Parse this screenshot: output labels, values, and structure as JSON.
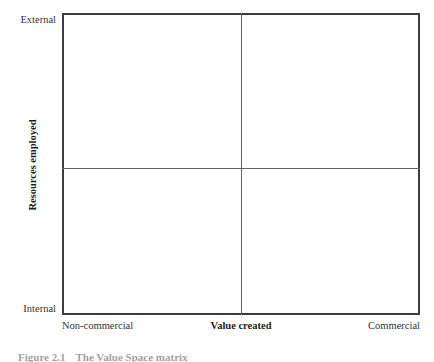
{
  "figure": {
    "caption_number": "Figure 2.1",
    "caption_text": "The Value Space matrix",
    "background_color": "#ffffff",
    "frame_color": "#3d3d3d",
    "divider_color": "#636363",
    "text_color": "#333333"
  },
  "chart_data": {
    "type": "scatter",
    "title": "",
    "subtitle": "",
    "xlabel": "Value created",
    "ylabel": "Resources employed",
    "x_tick_labels": [
      "Non-commercial",
      "Commercial"
    ],
    "y_tick_labels": [
      "Internal",
      "External"
    ],
    "xlim": [
      0,
      1
    ],
    "ylim": [
      0,
      1
    ],
    "grid": false,
    "legend": null,
    "series": [],
    "values": [],
    "categories": [],
    "annotations": [],
    "quadrant_dividers": {
      "vertical_x": 0.5,
      "horizontal_y": 0.5
    },
    "quadrants": [
      {
        "name": "top-left",
        "x_range": [
          "Non-commercial",
          "Value created"
        ],
        "y_range": [
          "Value created",
          "External"
        ],
        "label": ""
      },
      {
        "name": "top-right",
        "x_range": [
          "Value created",
          "Commercial"
        ],
        "y_range": [
          "Value created",
          "External"
        ],
        "label": ""
      },
      {
        "name": "bottom-left",
        "x_range": [
          "Non-commercial",
          "Value created"
        ],
        "y_range": [
          "Internal",
          "Value created"
        ],
        "label": ""
      },
      {
        "name": "bottom-right",
        "x_range": [
          "Value created",
          "Commercial"
        ],
        "y_range": [
          "Internal",
          "Value created"
        ],
        "label": ""
      }
    ]
  },
  "axes": {
    "y_top_label": "External",
    "y_bottom_label": "Internal",
    "y_title": "Resources employed",
    "x_left_label": "Non-commercial",
    "x_right_label": "Commercial",
    "x_title": "Value created"
  }
}
